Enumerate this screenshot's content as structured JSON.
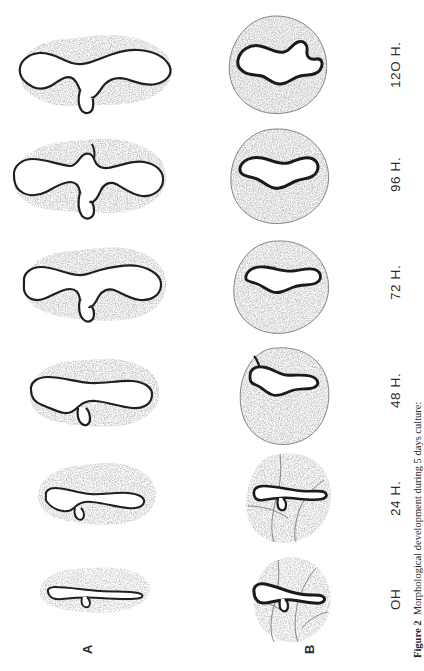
{
  "figure": {
    "label": "Figure 2",
    "caption": "Morphological development during 5 days culture:",
    "full_caption": "Figure 2  Morphological development during 5 days culture:"
  },
  "panels": [
    {
      "id": "A",
      "label": "A",
      "description": "isolated explant outlines, elongated convoluted lumen with stippled surrounding tissue"
    },
    {
      "id": "B",
      "label": "B",
      "description": "whole-mount explants, rounded stippled mass with dark convoluted band"
    }
  ],
  "timepoints": [
    {
      "label": "OH",
      "hours": 0
    },
    {
      "label": "24 H.",
      "hours": 24
    },
    {
      "label": "48 H.",
      "hours": 48
    },
    {
      "label": "72 H.",
      "hours": 72
    },
    {
      "label": "96 H.",
      "hours": 96
    },
    {
      "label": "12O H.",
      "hours": 120
    }
  ],
  "colors": {
    "ink": "#1a1a1a",
    "outline": "#262626",
    "stipple": "#5a5a5a",
    "paper": "#ffffff"
  },
  "orientation": {
    "page_rotation_deg": -90,
    "note": "All text in the plate is rotated 90 degrees counter-clockwise relative to the image."
  }
}
